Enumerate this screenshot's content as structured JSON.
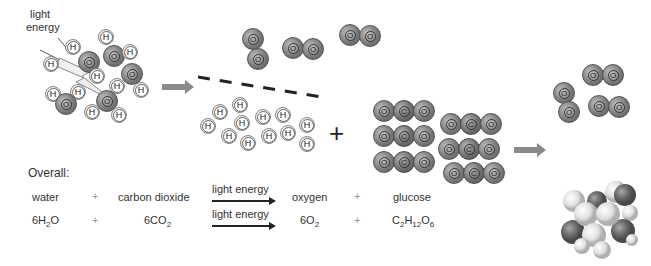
{
  "diagram": {
    "light_label": [
      "light",
      "energy"
    ],
    "atom_labels": {
      "hydrogen": "H",
      "oxygen": "O",
      "carbon": "C"
    },
    "big_plus": "+",
    "colors": {
      "oxygen": "#7a7a7a",
      "hydrogen": "#eeeeee",
      "carbon": "#5e5e5e",
      "arrow": "#8a8a8a"
    }
  },
  "overall": {
    "heading": "Overall:",
    "word_equation": {
      "reactant1": "water",
      "plus1": "+",
      "reactant2": "carbon dioxide",
      "arrow_label": "light energy",
      "product1": "oxygen",
      "plus2": "+",
      "product2": "glucose"
    },
    "formula_equation": {
      "reactant1": {
        "prefix": "6H",
        "sub": "2",
        "suffix": "O"
      },
      "plus1": "+",
      "reactant2": {
        "prefix": "6CO",
        "sub": "2",
        "suffix": ""
      },
      "arrow_label": "light energy",
      "product1": {
        "prefix": "6O",
        "sub": "2",
        "suffix": ""
      },
      "plus2": "+",
      "product2": {
        "c": "C",
        "c_sub": "2",
        "h": "H",
        "h_sub": "12",
        "o": "O",
        "o_sub": "6"
      }
    }
  }
}
